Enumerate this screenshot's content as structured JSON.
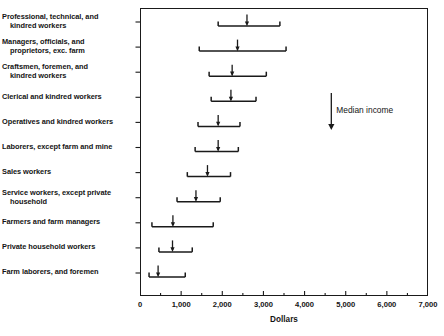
{
  "chart_data": {
    "type": "bar",
    "title": "",
    "subtitle": "",
    "xlabel": "Dollars",
    "ylabel": "",
    "xlim": [
      0,
      7000
    ],
    "grid": false,
    "legend_position": "none",
    "orientation": "horizontal",
    "x_ticks": [
      {
        "value": 0,
        "label": "0"
      },
      {
        "value": 1000,
        "label": "1,000"
      },
      {
        "value": 2000,
        "label": "2,000"
      },
      {
        "value": 3000,
        "label": "3,000"
      },
      {
        "value": 4000,
        "label": "4,000"
      },
      {
        "value": 5000,
        "label": "5,000"
      },
      {
        "value": 6000,
        "label": "6,000"
      },
      {
        "value": 7000,
        "label": "7,000"
      }
    ],
    "x_minor_tick_interval": 500,
    "categories": [
      "Professional, technical, and kindred workers",
      "Managers, officials, and proprietors, exc. farm",
      "Craftsmen, foremen, and kindred workers",
      "Clerical and kindred workers",
      "Operatives and kindred workers",
      "Laborers, except farm and mine",
      "Sales workers",
      "Service workers, except private household",
      "Farmers and farm managers",
      "Private household workers",
      "Farm laborers, and foremen"
    ],
    "category_label_lines": [
      [
        "Professional, technical, and",
        "kindred workers"
      ],
      [
        "Managers, officials, and",
        "proprietors, exc. farm"
      ],
      [
        "Craftsmen, foremen, and",
        "kindred workers"
      ],
      [
        "Clerical and kindred workers"
      ],
      [
        "Operatives and kindred workers"
      ],
      [
        "Laborers, except farm and mine"
      ],
      [
        "Sales workers"
      ],
      [
        "Service workers, except private",
        "household"
      ],
      [
        "Farmers and farm managers"
      ],
      [
        "Private household workers"
      ],
      [
        "Farm laborers, and foremen"
      ]
    ],
    "series": [
      {
        "name": "range_low",
        "values": [
          1900,
          1440,
          1680,
          1730,
          1410,
          1340,
          1150,
          900,
          290,
          460,
          220
        ]
      },
      {
        "name": "median_income",
        "values": [
          2600,
          2370,
          2240,
          2210,
          1900,
          1900,
          1640,
          1360,
          800,
          790,
          440
        ]
      },
      {
        "name": "range_high",
        "values": [
          3400,
          3550,
          3070,
          2820,
          2430,
          2390,
          2200,
          1950,
          1780,
          1270,
          1100
        ]
      }
    ],
    "annotations": [
      {
        "name": "median-income-arrow",
        "text": "Median income",
        "x_value": 4650,
        "arrow_direction": "down"
      }
    ],
    "colors": {
      "axis": "#1a1a1a",
      "bracket": "#1a1a1a",
      "median_marker": "#1a1a1a",
      "text": "#141414",
      "background": "#ffffff"
    }
  }
}
